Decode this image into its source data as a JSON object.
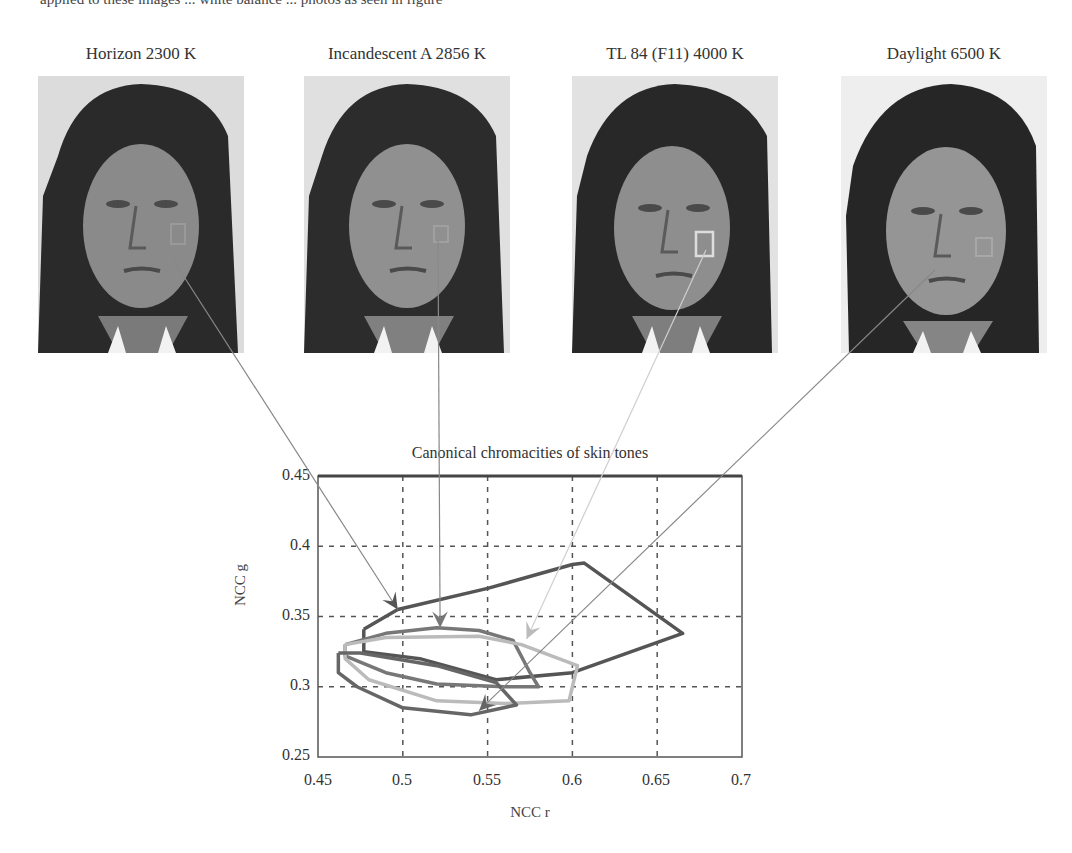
{
  "top_text_fragment": "applied to these images ... white balance ... photos as seen in figure",
  "photos": [
    {
      "label": "Horizon 2300 K",
      "left": 38
    },
    {
      "label": "Incandescent A 2856 K",
      "left": 304
    },
    {
      "label": "TL 84 (F11) 4000 K",
      "left": 572
    },
    {
      "label": "Daylight 6500 K",
      "left": 841
    }
  ],
  "chart_data": {
    "type": "line",
    "title": "Canonical chromacities of skin tones",
    "xlabel": "NCC r",
    "ylabel": "NCC g",
    "xlim": [
      0.45,
      0.7
    ],
    "ylim": [
      0.25,
      0.45
    ],
    "xticks": [
      "0.45",
      "0.5",
      "0.55",
      "0.6",
      "0.65",
      "0.7"
    ],
    "yticks": [
      "0.45",
      "0.4",
      "0.35",
      "0.3",
      "0.25"
    ],
    "grid": true,
    "legend": "none",
    "series": [
      {
        "name": "Horizon 2300 K",
        "color": "#555555",
        "points": [
          [
            0.477,
            0.341
          ],
          [
            0.497,
            0.355
          ],
          [
            0.55,
            0.37
          ],
          [
            0.6,
            0.387
          ],
          [
            0.607,
            0.388
          ],
          [
            0.665,
            0.338
          ],
          [
            0.6,
            0.31
          ],
          [
            0.555,
            0.305
          ],
          [
            0.51,
            0.32
          ],
          [
            0.477,
            0.325
          ],
          [
            0.477,
            0.341
          ]
        ],
        "arrow_at": [
          0.497,
          0.355
        ]
      },
      {
        "name": "Incandescent A 2856 K",
        "color": "#777777",
        "points": [
          [
            0.466,
            0.33
          ],
          [
            0.49,
            0.338
          ],
          [
            0.52,
            0.342
          ],
          [
            0.545,
            0.34
          ],
          [
            0.565,
            0.333
          ],
          [
            0.575,
            0.31
          ],
          [
            0.58,
            0.3
          ],
          [
            0.56,
            0.3
          ],
          [
            0.52,
            0.302
          ],
          [
            0.49,
            0.31
          ],
          [
            0.466,
            0.322
          ],
          [
            0.466,
            0.33
          ]
        ],
        "arrow_at": [
          0.522,
          0.342
        ]
      },
      {
        "name": "TL 84 (F11) 4000 K",
        "color": "#bbbbbb",
        "points": [
          [
            0.466,
            0.33
          ],
          [
            0.49,
            0.335
          ],
          [
            0.545,
            0.336
          ],
          [
            0.57,
            0.33
          ],
          [
            0.603,
            0.315
          ],
          [
            0.598,
            0.29
          ],
          [
            0.56,
            0.288
          ],
          [
            0.52,
            0.29
          ],
          [
            0.48,
            0.305
          ],
          [
            0.466,
            0.32
          ],
          [
            0.466,
            0.33
          ]
        ],
        "arrow_at": [
          0.573,
          0.334
        ]
      },
      {
        "name": "Daylight 6500 K",
        "color": "#666666",
        "points": [
          [
            0.462,
            0.324
          ],
          [
            0.475,
            0.324
          ],
          [
            0.52,
            0.315
          ],
          [
            0.555,
            0.303
          ],
          [
            0.567,
            0.287
          ],
          [
            0.54,
            0.28
          ],
          [
            0.5,
            0.285
          ],
          [
            0.473,
            0.3
          ],
          [
            0.462,
            0.31
          ],
          [
            0.462,
            0.324
          ]
        ],
        "arrow_at": [
          0.545,
          0.283
        ]
      }
    ],
    "connector_lines": [
      {
        "from_photo": "Horizon 2300 K",
        "to": [
          0.497,
          0.355
        ]
      },
      {
        "from_photo": "Incandescent A 2856 K",
        "to": [
          0.522,
          0.342
        ]
      },
      {
        "from_photo": "TL 84 (F11) 4000 K",
        "to": [
          0.573,
          0.334
        ]
      },
      {
        "from_photo": "Daylight 6500 K",
        "to": [
          0.545,
          0.283
        ]
      }
    ]
  }
}
